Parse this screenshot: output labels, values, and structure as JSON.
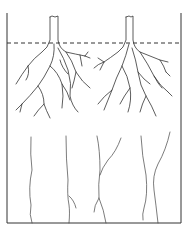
{
  "figure": {
    "container": {
      "left": 7,
      "right": 181,
      "top": 13,
      "bottom": 223
    },
    "level_line_y": 43,
    "plants": [
      {
        "name": "left-plant",
        "stem_x": 54
      },
      {
        "name": "right-plant",
        "stem_x": 129
      }
    ],
    "long_roots_count": 6,
    "stroke_color": "#333333",
    "background_color": "#ffffff"
  }
}
